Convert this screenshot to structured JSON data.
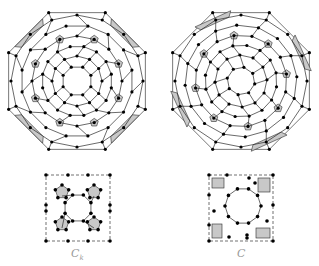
{
  "figure": {
    "left": {
      "label": "C",
      "label_sub": "k",
      "sphere": {
        "cx": 77,
        "cy": 81,
        "rings": [
          74,
          66,
          56,
          45,
          35,
          25,
          15
        ],
        "sides": 8
      },
      "tile": {
        "x": 46,
        "y": 175,
        "w": 64,
        "h": 66
      }
    },
    "right": {
      "label": "C",
      "label_sub": "",
      "sphere": {
        "cx": 241,
        "cy": 81,
        "rings": [
          74,
          66,
          56,
          46,
          36,
          26,
          14
        ],
        "sides": 8
      },
      "tile": {
        "x": 209,
        "y": 175,
        "w": 64,
        "h": 66
      }
    },
    "colors": {
      "shaded_face": "#c8c8c8",
      "node": "#000000",
      "edge": "#2a2a2a",
      "label": "#9a9a9a"
    }
  }
}
